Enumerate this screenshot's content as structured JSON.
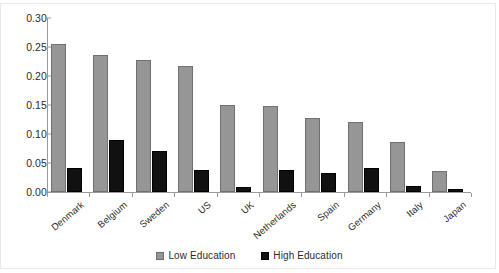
{
  "chart_data": {
    "type": "bar",
    "title": "",
    "subtitle": "",
    "xlabel": "",
    "ylabel": "",
    "categories": [
      "Denmark",
      "Belgium",
      "Sweden",
      "US",
      "UK",
      "Netherlands",
      "Spain",
      "Germany",
      "Italy",
      "Japan"
    ],
    "series": [
      {
        "name": "Low Education",
        "color": "#969696",
        "values": [
          0.256,
          0.236,
          0.227,
          0.217,
          0.15,
          0.149,
          0.128,
          0.12,
          0.086,
          0.036
        ]
      },
      {
        "name": "High Education",
        "color": "#111111",
        "values": [
          0.042,
          0.089,
          0.071,
          0.038,
          0.008,
          0.038,
          0.032,
          0.041,
          0.011,
          0.005
        ]
      }
    ],
    "ylim": [
      0.0,
      0.3
    ],
    "ytick_values": [
      0.0,
      0.05,
      0.1,
      0.15,
      0.2,
      0.25,
      0.3
    ],
    "ytick_labels": [
      "0.00",
      "0.05",
      "0.10",
      "0.15",
      "0.20",
      "0.25",
      "0.30"
    ],
    "grid": false,
    "legend_position": "bottom",
    "xtick_label_rotation": -40
  },
  "legend": {
    "items": [
      {
        "label": "Low Education",
        "swatch": "low"
      },
      {
        "label": "High Education",
        "swatch": "high"
      }
    ]
  }
}
